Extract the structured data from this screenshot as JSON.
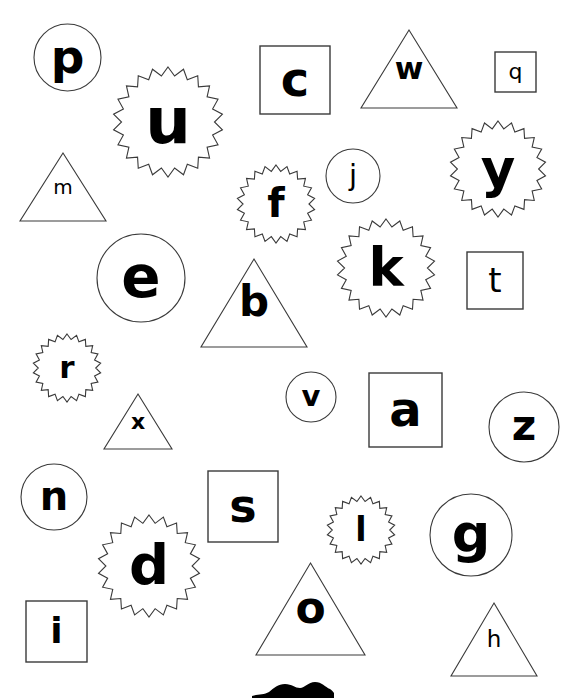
{
  "page": {
    "background_color": "#ffffff",
    "ink_color": "#000000",
    "outline_color": "#3a3a3a",
    "width": 584,
    "height": 698
  },
  "shape_types": [
    "circle",
    "square",
    "triangle",
    "starburst"
  ],
  "items": [
    {
      "letter": "p",
      "shape": "circle",
      "x": 33,
      "y": 23,
      "w": 69,
      "h": 69,
      "font_size": 47,
      "font_weight": 600
    },
    {
      "letter": "u",
      "shape": "starburst",
      "x": 112,
      "y": 66,
      "w": 112,
      "h": 112,
      "font_size": 64,
      "font_weight": 700
    },
    {
      "letter": "c",
      "shape": "square",
      "x": 259,
      "y": 45,
      "w": 72,
      "h": 70,
      "font_size": 48,
      "font_weight": 600
    },
    {
      "letter": "w",
      "shape": "triangle",
      "x": 360,
      "y": 29,
      "w": 98,
      "h": 80,
      "font_size": 31,
      "font_weight": 600
    },
    {
      "letter": "q",
      "shape": "square",
      "x": 494,
      "y": 51,
      "w": 43,
      "h": 42,
      "font_size": 22,
      "font_weight": 500
    },
    {
      "letter": "m",
      "shape": "triangle",
      "x": 19,
      "y": 152,
      "w": 88,
      "h": 70,
      "font_size": 20,
      "font_weight": 500
    },
    {
      "letter": "f",
      "shape": "starburst",
      "x": 236,
      "y": 164,
      "w": 80,
      "h": 80,
      "font_size": 40,
      "font_weight": 700
    },
    {
      "letter": "j",
      "shape": "circle",
      "x": 325,
      "y": 148,
      "w": 56,
      "h": 56,
      "font_size": 29,
      "font_weight": 500
    },
    {
      "letter": "y",
      "shape": "starburst",
      "x": 449,
      "y": 120,
      "w": 98,
      "h": 98,
      "font_size": 53,
      "font_weight": 700
    },
    {
      "letter": "e",
      "shape": "circle",
      "x": 96,
      "y": 233,
      "w": 90,
      "h": 90,
      "font_size": 58,
      "font_weight": 600
    },
    {
      "letter": "k",
      "shape": "starburst",
      "x": 336,
      "y": 218,
      "w": 100,
      "h": 100,
      "font_size": 53,
      "font_weight": 700
    },
    {
      "letter": "t",
      "shape": "square",
      "x": 466,
      "y": 251,
      "w": 58,
      "h": 59,
      "font_size": 34,
      "font_weight": 500
    },
    {
      "letter": "b",
      "shape": "triangle",
      "x": 200,
      "y": 258,
      "w": 108,
      "h": 90,
      "font_size": 42,
      "font_weight": 700
    },
    {
      "letter": "r",
      "shape": "starburst",
      "x": 32,
      "y": 333,
      "w": 70,
      "h": 70,
      "font_size": 31,
      "font_weight": 600
    },
    {
      "letter": "v",
      "shape": "circle",
      "x": 285,
      "y": 371,
      "w": 52,
      "h": 52,
      "font_size": 29,
      "font_weight": 600
    },
    {
      "letter": "a",
      "shape": "square",
      "x": 368,
      "y": 372,
      "w": 75,
      "h": 76,
      "font_size": 48,
      "font_weight": 700
    },
    {
      "letter": "z",
      "shape": "circle",
      "x": 488,
      "y": 391,
      "w": 72,
      "h": 72,
      "font_size": 42,
      "font_weight": 700
    },
    {
      "letter": "x",
      "shape": "triangle",
      "x": 103,
      "y": 393,
      "w": 70,
      "h": 57,
      "font_size": 22,
      "font_weight": 600
    },
    {
      "letter": "n",
      "shape": "circle",
      "x": 20,
      "y": 463,
      "w": 68,
      "h": 68,
      "font_size": 40,
      "font_weight": 600
    },
    {
      "letter": "s",
      "shape": "square",
      "x": 207,
      "y": 470,
      "w": 72,
      "h": 73,
      "font_size": 46,
      "font_weight": 700
    },
    {
      "letter": "d",
      "shape": "starburst",
      "x": 97,
      "y": 514,
      "w": 104,
      "h": 104,
      "font_size": 56,
      "font_weight": 700
    },
    {
      "letter": "l",
      "shape": "starburst",
      "x": 326,
      "y": 495,
      "w": 70,
      "h": 70,
      "font_size": 33,
      "font_weight": 600
    },
    {
      "letter": "g",
      "shape": "circle",
      "x": 429,
      "y": 493,
      "w": 84,
      "h": 84,
      "font_size": 54,
      "font_weight": 700
    },
    {
      "letter": "i",
      "shape": "square",
      "x": 25,
      "y": 600,
      "w": 63,
      "h": 63,
      "font_size": 36,
      "font_weight": 600
    },
    {
      "letter": "o",
      "shape": "triangle",
      "x": 255,
      "y": 562,
      "w": 111,
      "h": 94,
      "font_size": 44,
      "font_weight": 700
    },
    {
      "letter": "h",
      "shape": "triangle",
      "x": 450,
      "y": 602,
      "w": 88,
      "h": 75,
      "font_size": 23,
      "font_weight": 500
    }
  ],
  "bottom_decoration": {
    "name": "cut-off-dark-shape",
    "x": 252,
    "y": 676,
    "w": 82,
    "h": 22,
    "color": "#000000"
  }
}
